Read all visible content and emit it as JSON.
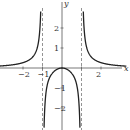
{
  "chart_data": {
    "type": "line",
    "title": "",
    "xlabel": "x",
    "ylabel": "y",
    "xlim": [
      -3.1,
      3.4
    ],
    "ylim": [
      -3.1,
      3.3
    ],
    "x_ticks": [
      -2,
      -1,
      1,
      2
    ],
    "x_tick_labels": [
      "−2",
      "−1",
      "",
      "2"
    ],
    "y_ticks": [
      -2,
      -1,
      1,
      2
    ],
    "y_tick_labels": [
      "−2",
      "−1",
      "1",
      "2"
    ],
    "asymptotes": {
      "vertical": [
        -1,
        1
      ],
      "horizontal": [
        0
      ]
    },
    "grid": false,
    "legend": null,
    "series": [
      {
        "name": "curve",
        "expression": "x^2/(x^4-1)",
        "points": [
          [
            -3,
            0.1125
          ],
          [
            -2,
            0.2667
          ],
          [
            -1.5,
            0.5538
          ],
          [
            -1.2,
            1.3895
          ],
          [
            -1.1,
            2.6
          ],
          [
            0,
            0
          ],
          [
            -0.5,
            -0.2667
          ],
          [
            0.5,
            -0.2667
          ],
          [
            -0.9,
            -2.36
          ],
          [
            0.9,
            -2.36
          ],
          [
            1.1,
            2.6
          ],
          [
            1.2,
            1.3895
          ],
          [
            1.5,
            0.5538
          ],
          [
            2,
            0.2667
          ],
          [
            3,
            0.1125
          ]
        ]
      }
    ]
  },
  "axes": {
    "x_label": "x",
    "y_label": "y"
  },
  "ticks": {
    "x": [
      {
        "v": -2,
        "t": "−2"
      },
      {
        "v": -1,
        "t": "−1"
      },
      {
        "v": 2,
        "t": "2"
      }
    ],
    "y": [
      {
        "v": 2,
        "t": "2"
      },
      {
        "v": 1,
        "t": "1"
      },
      {
        "v": -1,
        "t": "−1"
      },
      {
        "v": -2,
        "t": "−2"
      }
    ]
  }
}
